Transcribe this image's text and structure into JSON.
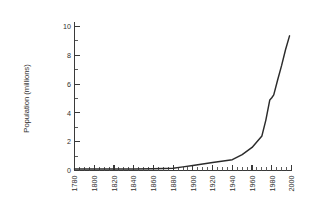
{
  "chart_data": {
    "type": "line",
    "title": "",
    "subtitle": "",
    "xlabel": "",
    "ylabel": "Population (millions)",
    "xlim": [
      1780,
      2000
    ],
    "ylim": [
      0,
      11
    ],
    "grid": false,
    "legend": null,
    "legend_position": "none",
    "x_tick_labels": [
      "1780",
      "1800",
      "1820",
      "1840",
      "1860",
      "1880",
      "1900",
      "1920",
      "1940",
      "1960",
      "1980",
      "2000"
    ],
    "x_tick_values": [
      1780,
      1800,
      1820,
      1840,
      1860,
      1880,
      1900,
      1920,
      1940,
      1960,
      1980,
      2000
    ],
    "x_tick_rotation_deg": 90,
    "x_minor_tick_interval": 5,
    "y_tick_labels": [
      "0",
      "2",
      "4",
      "6",
      "8",
      "10"
    ],
    "y_tick_values": [
      0,
      2,
      4,
      6,
      8,
      10
    ],
    "y_minor_tick_interval": 1,
    "series": [
      {
        "name": "Population",
        "color": "#2b2b2b",
        "x": [
          1780,
          1800,
          1820,
          1840,
          1860,
          1880,
          1890,
          1900,
          1920,
          1940,
          1950,
          1960,
          1970,
          1974,
          1978,
          1980,
          1982,
          1986,
          1990,
          1994,
          1998
        ],
        "values": [
          0.1,
          0.1,
          0.1,
          0.1,
          0.12,
          0.15,
          0.25,
          0.35,
          0.55,
          0.75,
          1.1,
          1.6,
          2.4,
          3.5,
          4.9,
          5.05,
          5.25,
          6.3,
          7.3,
          8.4,
          9.35
        ]
      }
    ],
    "annotations": []
  },
  "axes": {
    "y_axis_title": "Population (millions)"
  }
}
